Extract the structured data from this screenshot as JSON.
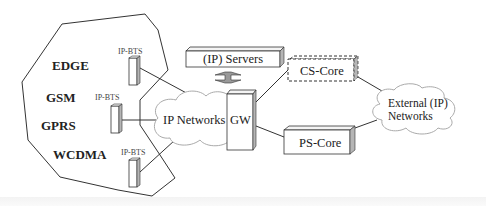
{
  "diagram": {
    "access_technologies": [
      "EDGE",
      "GSM",
      "GPRS",
      "WCDMA"
    ],
    "bts_label": "IP-BTS",
    "bts_count": 3,
    "ip_networks_label": "IP Networks",
    "gw_label": "GW",
    "servers_label": "(IP) Servers",
    "cs_core_label": "CS-Core",
    "ps_core_label": "PS-Core",
    "external_networks_label_line1": "External (IP)",
    "external_networks_label_line2": "Networks",
    "colors": {
      "line": "#333333",
      "box_fill": "#ffffff",
      "box_side_shade": "#b5b5b5",
      "arrow_fill": "#999999",
      "cloud_stroke": "#aaaaaa"
    }
  }
}
